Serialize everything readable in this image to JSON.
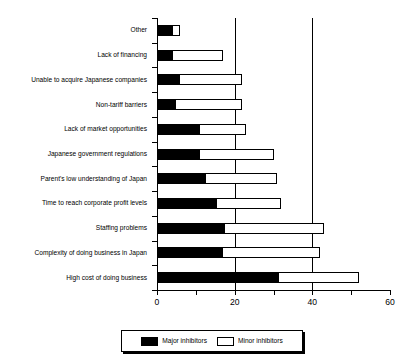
{
  "chart_data": {
    "type": "bar",
    "orientation": "horizontal",
    "stacked": true,
    "title": "",
    "xlabel": "",
    "ylabel": "",
    "xlim": [
      0,
      60
    ],
    "xticks": [
      0,
      10,
      20,
      30,
      40,
      50,
      60
    ],
    "xtick_labels": [
      "0",
      "",
      "20",
      "",
      "40",
      "",
      "60"
    ],
    "gridlines_at": [
      20,
      40
    ],
    "grid": true,
    "legend_position": "bottom",
    "categories": [
      "Other",
      "Lack of financing",
      "Unable to acquire Japanese companies",
      "Non-tariff barriers",
      "Lack of market opportunities",
      "Japanese government regulations",
      "Parent's low understanding of Japan",
      "Time to reach corporate profit levels",
      "Staffing problems",
      "Complexity of doing business in Japan",
      "High cost of doing business"
    ],
    "series": [
      {
        "name": "Major inhibitors",
        "color": "#000000",
        "values": [
          4,
          4,
          6,
          5,
          11,
          11,
          12.5,
          15.5,
          17.5,
          17,
          31.5
        ]
      },
      {
        "name": "Minor inhibitors",
        "color": "#ffffff",
        "values": [
          2,
          13,
          16,
          17,
          12,
          19,
          18.5,
          16.5,
          25.5,
          25,
          20.5
        ]
      }
    ],
    "totals": [
      6,
      17,
      22,
      22,
      23,
      30,
      31,
      32,
      43,
      42,
      52
    ]
  },
  "legend": {
    "entries": [
      {
        "label": "Major inhibitors",
        "swatch": "filled-black-swatch"
      },
      {
        "label": "Minor inhibitors",
        "swatch": "outlined-white-swatch"
      }
    ]
  },
  "colors": {
    "major": "#000000",
    "minor": "#ffffff",
    "axis": "#000000",
    "background": "#ffffff"
  }
}
